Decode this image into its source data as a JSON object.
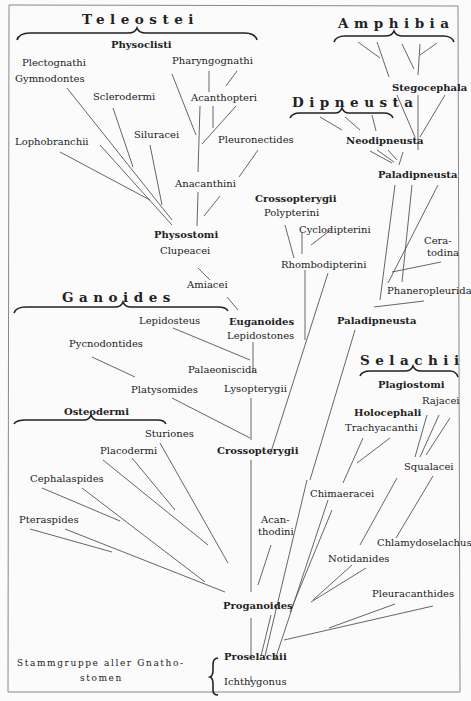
{
  "figure": {
    "groups": {
      "teleostei": "Teleostei",
      "amphibia": "Amphibia",
      "dipneusta": "Dipneusta",
      "ganoides": "Ganoides",
      "selachii": "Selachii",
      "osteodermi": "Osteodermi"
    },
    "taxa": {
      "physoclisti": "Physoclisti",
      "plectognathi": "Plectognathi",
      "gymnodontes": "Gymnodontes",
      "pharyngognathi": "Pharyngognathi",
      "sclerodermi": "Sclerodermi",
      "acanthopteri": "Acanthopteri",
      "lophobranchii": "Lophobranchii",
      "siluracei": "Siluracei",
      "pleuronectides": "Pleuronectides",
      "anacanthini": "Anacanthini",
      "physostomi": "Physostomi",
      "clupeacei": "Clupeacei",
      "amiacei": "Amiacei",
      "stegocephala": "Stegocephala",
      "neodipneusta": "Neodipneusta",
      "paladipneusta_top": "Paladipneusta",
      "crossopterygii_top": "Crossopterygii",
      "polypterini": "Polypterini",
      "cyclodipterini": "Cyclodipterini",
      "rhombodipterini": "Rhombodipterini",
      "ceratodina_1": "Cera-",
      "ceratodina_2": "todina",
      "phaneropleurida": "Phaneropleurida",
      "paladipneusta_mid": "Paladipneusta",
      "euganoides": "Euganoides",
      "lepidosteus": "Lepidosteus",
      "lepidostones": "Lepidostones",
      "pycnodontides": "Pycnodontides",
      "palaeoniscida": "Palaeoniscida",
      "platysomides": "Platysomides",
      "lysopterygii": "Lysopterygii",
      "sturiones": "Sturiones",
      "placodermi": "Placodermi",
      "crossopterygii_mid": "Crossopterygii",
      "cephalaspides": "Cephalaspides",
      "pteraspides": "Pteraspides",
      "acanthodini_1": "Acan-",
      "acanthodini_2": "thodini",
      "proganoides": "Proganoides",
      "plagiostomi": "Plagiostomi",
      "rajacei": "Rajacei",
      "holocephali": "Holocephali",
      "trachyacanthi": "Trachyacanthi",
      "squalacei": "Squalacei",
      "chimaeracei": "Chimaeracei",
      "chlamydoselachus": "Chlamydoselachus",
      "notidanides": "Notidanides",
      "pleuracanthides": "Pleuracanthides",
      "proselachii": "Proselachii",
      "ichthygonus": "Ichthygonus"
    },
    "root_caption": {
      "line1": "Stammgruppe aller Gnatho-",
      "line2": "stomen"
    }
  }
}
